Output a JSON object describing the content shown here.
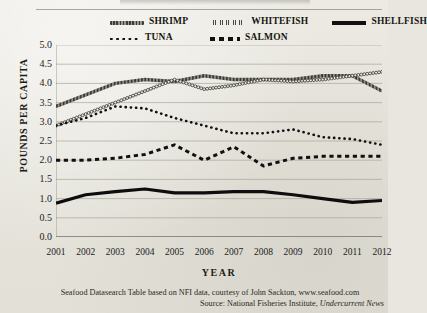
{
  "legend": {
    "items": [
      {
        "label": "SHRIMP",
        "key": "shrimp-line-swatch"
      },
      {
        "label": "WHITEFISH",
        "key": "whitefish-line-swatch"
      },
      {
        "label": "SHELLFISH",
        "key": "shellfish-line-swatch"
      },
      {
        "label": "TUNA",
        "key": "tuna-line-swatch"
      },
      {
        "label": "SALMON",
        "key": "salmon-line-swatch"
      }
    ]
  },
  "axes": {
    "ylabel": "POUNDS PER CAPITA",
    "xlabel": "YEAR",
    "yticks": [
      "5.0",
      "4.5",
      "4.0",
      "3.5",
      "3.0",
      "2.5",
      "2.0",
      "1.5",
      "1.0",
      "0.5",
      "0.0"
    ],
    "xticks": [
      "2001",
      "2002",
      "2003",
      "2004",
      "2005",
      "2006",
      "2007",
      "2008",
      "2009",
      "2010",
      "2011",
      "2012"
    ]
  },
  "footer": {
    "line1": "Seafood Datasearch Table based on NFI data, courtesy of John Sackton, www.seafood.com",
    "line2_prefix": "Source:  National Fisheries Institute, ",
    "line2_italic": "Undercurrent News"
  },
  "chart_data": {
    "type": "line",
    "title": "",
    "xlabel": "YEAR",
    "ylabel": "POUNDS PER CAPITA",
    "x": [
      2001,
      2002,
      2003,
      2004,
      2005,
      2006,
      2007,
      2008,
      2009,
      2010,
      2011,
      2012
    ],
    "xlim": [
      2001,
      2012
    ],
    "ylim": [
      0.0,
      5.0
    ],
    "ytick_step": 0.5,
    "grid": true,
    "legend_position": "top",
    "series": [
      {
        "name": "SHRIMP",
        "style": "thick-textured-gray",
        "values": [
          3.4,
          3.7,
          4.0,
          4.1,
          4.05,
          4.2,
          4.1,
          4.1,
          4.1,
          4.2,
          4.2,
          3.8
        ]
      },
      {
        "name": "WHITEFISH",
        "style": "open-circle-markers",
        "values": [
          2.9,
          3.2,
          3.5,
          3.8,
          4.1,
          3.85,
          3.95,
          4.1,
          4.05,
          4.1,
          4.2,
          4.3
        ]
      },
      {
        "name": "TUNA",
        "style": "fine-dotted",
        "values": [
          2.9,
          3.1,
          3.4,
          3.35,
          3.1,
          2.9,
          2.7,
          2.7,
          2.8,
          2.6,
          2.55,
          2.4
        ]
      },
      {
        "name": "SALMON",
        "style": "dashed",
        "values": [
          2.0,
          2.0,
          2.05,
          2.15,
          2.4,
          2.0,
          2.35,
          1.85,
          2.05,
          2.1,
          2.1,
          2.1
        ]
      },
      {
        "name": "SHELLFISH",
        "style": "thick-solid-black",
        "values": [
          0.88,
          1.1,
          1.18,
          1.25,
          1.15,
          1.15,
          1.18,
          1.18,
          1.1,
          1.0,
          0.9,
          0.95
        ]
      }
    ]
  }
}
